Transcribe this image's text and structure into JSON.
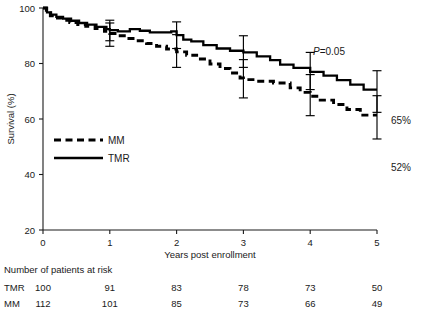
{
  "chart_data": {
    "type": "line",
    "title": "",
    "xlabel": "Years post enrollment",
    "ylabel": "Survival (%)",
    "xlim": [
      0,
      5
    ],
    "ylim": [
      20,
      100
    ],
    "xticks": [
      0,
      1,
      2,
      3,
      4,
      5
    ],
    "yticks": [
      20,
      40,
      60,
      80,
      100
    ],
    "xtick_labels": [
      "0",
      "1",
      "2",
      "3",
      "4",
      "5"
    ],
    "ytick_labels": [
      "20",
      "40",
      "60",
      "80",
      "100"
    ],
    "grid": false,
    "legend_position": "middle-left",
    "annotations": {
      "pvalue_prefix": "P",
      "pvalue_rest": "=0.05",
      "tmr_endpoint_label": "65%",
      "mm_endpoint_label": "52%"
    },
    "series": [
      {
        "name": "TMR",
        "style": "solid",
        "color": "#000000",
        "legend_label": "TMR",
        "endpoint_value": 65,
        "points": [
          [
            0.0,
            100
          ],
          [
            0.06,
            100
          ],
          [
            0.06,
            98.4
          ],
          [
            0.12,
            98.4
          ],
          [
            0.12,
            97.6
          ],
          [
            0.2,
            97.6
          ],
          [
            0.2,
            96.8
          ],
          [
            0.3,
            96.8
          ],
          [
            0.3,
            96.2
          ],
          [
            0.42,
            96.2
          ],
          [
            0.42,
            95.4
          ],
          [
            0.54,
            95.4
          ],
          [
            0.54,
            94.6
          ],
          [
            0.66,
            94.6
          ],
          [
            0.66,
            94.0
          ],
          [
            0.8,
            94.0
          ],
          [
            0.8,
            93.2
          ],
          [
            0.95,
            93.2
          ],
          [
            0.95,
            92.4
          ],
          [
            1.0,
            92.4
          ],
          [
            1.0,
            92.0
          ],
          [
            1.12,
            92.0
          ],
          [
            1.12,
            91.6
          ],
          [
            1.3,
            91.6
          ],
          [
            1.3,
            92.4
          ],
          [
            1.45,
            92.4
          ],
          [
            1.45,
            91.8
          ],
          [
            1.6,
            91.8
          ],
          [
            1.6,
            91.2
          ],
          [
            1.8,
            91.2
          ],
          [
            1.92,
            91.2
          ],
          [
            1.92,
            91.6
          ],
          [
            2.0,
            91.6
          ],
          [
            2.0,
            90.2
          ],
          [
            2.1,
            90.2
          ],
          [
            2.1,
            88.6
          ],
          [
            2.22,
            88.6
          ],
          [
            2.22,
            88.0
          ],
          [
            2.4,
            88.0
          ],
          [
            2.4,
            86.6
          ],
          [
            2.6,
            86.6
          ],
          [
            2.6,
            85.4
          ],
          [
            2.8,
            85.4
          ],
          [
            2.8,
            84.6
          ],
          [
            3.0,
            84.6
          ],
          [
            3.0,
            84.0
          ],
          [
            3.2,
            84.0
          ],
          [
            3.2,
            82.6
          ],
          [
            3.4,
            82.6
          ],
          [
            3.4,
            81.2
          ],
          [
            3.55,
            81.2
          ],
          [
            3.55,
            79.6
          ],
          [
            3.75,
            79.6
          ],
          [
            3.75,
            78.4
          ],
          [
            4.0,
            78.4
          ],
          [
            4.0,
            77.0
          ],
          [
            4.2,
            77.0
          ],
          [
            4.2,
            75.6
          ],
          [
            4.4,
            75.6
          ],
          [
            4.4,
            74.0
          ],
          [
            4.6,
            74.0
          ],
          [
            4.6,
            72.4
          ],
          [
            4.8,
            72.4
          ],
          [
            4.8,
            70.6
          ],
          [
            5.0,
            70.6
          ]
        ],
        "error_bars": [
          {
            "x": 1.0,
            "y": 92.0,
            "lower": 88.2,
            "upper": 95.6
          },
          {
            "x": 2.0,
            "y": 90.4,
            "lower": 85.4,
            "upper": 95.0
          },
          {
            "x": 3.0,
            "y": 84.4,
            "lower": 78.6,
            "upper": 90.0
          },
          {
            "x": 4.0,
            "y": 77.4,
            "lower": 70.6,
            "upper": 84.0
          },
          {
            "x": 5.0,
            "y": 70.0,
            "lower": 62.4,
            "upper": 77.4
          }
        ]
      },
      {
        "name": "MM",
        "style": "dashed",
        "color": "#000000",
        "legend_label": "MM",
        "endpoint_value": 52,
        "points": [
          [
            0.0,
            100
          ],
          [
            0.05,
            100
          ],
          [
            0.05,
            98.2
          ],
          [
            0.11,
            98.2
          ],
          [
            0.11,
            97.2
          ],
          [
            0.18,
            97.2
          ],
          [
            0.18,
            96.4
          ],
          [
            0.28,
            96.4
          ],
          [
            0.28,
            95.6
          ],
          [
            0.4,
            95.6
          ],
          [
            0.4,
            94.8
          ],
          [
            0.52,
            94.8
          ],
          [
            0.52,
            94.0
          ],
          [
            0.64,
            94.0
          ],
          [
            0.64,
            93.4
          ],
          [
            0.78,
            93.4
          ],
          [
            0.78,
            92.6
          ],
          [
            0.92,
            92.6
          ],
          [
            0.92,
            91.6
          ],
          [
            1.0,
            91.6
          ],
          [
            1.0,
            90.8
          ],
          [
            1.1,
            90.8
          ],
          [
            1.1,
            90.0
          ],
          [
            1.25,
            90.0
          ],
          [
            1.25,
            89.0
          ],
          [
            1.4,
            89.0
          ],
          [
            1.4,
            88.2
          ],
          [
            1.55,
            88.2
          ],
          [
            1.55,
            87.2
          ],
          [
            1.7,
            87.2
          ],
          [
            1.7,
            86.2
          ],
          [
            1.85,
            86.2
          ],
          [
            1.85,
            85.2
          ],
          [
            2.0,
            85.2
          ],
          [
            2.0,
            84.2
          ],
          [
            2.15,
            84.2
          ],
          [
            2.15,
            83.0
          ],
          [
            2.3,
            83.0
          ],
          [
            2.3,
            81.6
          ],
          [
            2.5,
            81.6
          ],
          [
            2.5,
            79.8
          ],
          [
            2.65,
            79.8
          ],
          [
            2.65,
            78.2
          ],
          [
            2.8,
            78.2
          ],
          [
            2.8,
            76.6
          ],
          [
            2.95,
            76.6
          ],
          [
            2.95,
            74.8
          ],
          [
            3.0,
            74.8
          ],
          [
            3.0,
            74.2
          ],
          [
            3.2,
            74.2
          ],
          [
            3.2,
            73.6
          ],
          [
            3.45,
            73.6
          ],
          [
            3.45,
            73.0
          ],
          [
            3.7,
            73.0
          ],
          [
            3.7,
            71.2
          ],
          [
            3.85,
            71.2
          ],
          [
            3.85,
            69.6
          ],
          [
            4.0,
            69.6
          ],
          [
            4.0,
            68.2
          ],
          [
            4.15,
            68.2
          ],
          [
            4.15,
            66.8
          ],
          [
            4.35,
            66.8
          ],
          [
            4.35,
            65.2
          ],
          [
            4.55,
            65.2
          ],
          [
            4.55,
            63.4
          ],
          [
            4.75,
            63.4
          ],
          [
            4.75,
            61.4
          ],
          [
            5.0,
            61.4
          ]
        ],
        "error_bars": [
          {
            "x": 1.0,
            "y": 90.6,
            "lower": 86.2,
            "upper": 94.6
          },
          {
            "x": 2.0,
            "y": 84.6,
            "lower": 78.6,
            "upper": 90.4
          },
          {
            "x": 3.0,
            "y": 74.6,
            "lower": 67.6,
            "upper": 81.4
          },
          {
            "x": 4.0,
            "y": 68.6,
            "lower": 61.2,
            "upper": 76.0
          },
          {
            "x": 5.0,
            "y": 60.6,
            "lower": 52.8,
            "upper": 68.4
          }
        ]
      }
    ]
  },
  "risk_table": {
    "title": "Number of patients at risk",
    "rows": [
      {
        "label": "TMR",
        "values": [
          "100",
          "91",
          "83",
          "78",
          "73",
          "50"
        ]
      },
      {
        "label": "MM",
        "values": [
          "112",
          "101",
          "85",
          "73",
          "66",
          "49"
        ]
      }
    ]
  }
}
